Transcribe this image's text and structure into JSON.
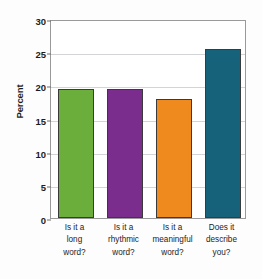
{
  "chart_data": {
    "type": "bar",
    "title": "",
    "subtitle": "",
    "xlabel": "",
    "ylabel": "Percent",
    "ylim": [
      0,
      30
    ],
    "ytick_values": [
      0,
      5,
      10,
      15,
      20,
      25,
      30
    ],
    "ytick_labels": [
      "0",
      "5",
      "10",
      "15",
      "20",
      "25",
      "30"
    ],
    "grid": true,
    "legend": false,
    "categories": [
      "Is it a long word?",
      "Is it a rhythmic word?",
      "Is it a meaningful word?",
      "Does it describe you?"
    ],
    "category_lines": [
      [
        "Is it a",
        "long",
        "word?"
      ],
      [
        "Is it a",
        "rhythmic",
        "word?"
      ],
      [
        "Is it a",
        "meaningful",
        "word?"
      ],
      [
        "Does it",
        "describe",
        "you?"
      ]
    ],
    "values": [
      19.4,
      19.4,
      17.9,
      25.5
    ],
    "colors": [
      "#6CAE3C",
      "#7B2D8E",
      "#EF8B1E",
      "#17627B"
    ],
    "bar_edge_color": "#3A3A3A",
    "gridline_color": "#D2D4D8",
    "axis_color": "#9A9A9A",
    "background_color": "#FFFFFF",
    "text_color": "#1C1C1C"
  }
}
